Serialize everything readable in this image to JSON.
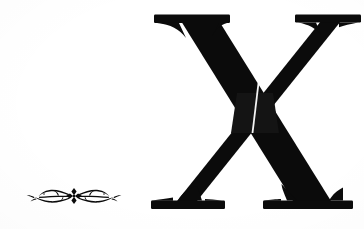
{
  "page": {
    "kind": "scanned-book-page",
    "background_color": "#ffffff",
    "ink_color": "#0b0b0b",
    "width": 364,
    "height": 229
  },
  "initial": {
    "character": "X",
    "role": "chapter-initial-capital",
    "style": "serif-didone-slab-serif",
    "color": "#0b0b0b",
    "position": {
      "left": 145,
      "top": 5,
      "width": 216,
      "height": 220
    },
    "description": "Large black serif capital letter X with flat bracketed slab serifs at all four terminals and a thin hairline seam where the two strokes cross"
  },
  "ornament": {
    "role": "decorative-rule",
    "name": "floral-flourish-ornament",
    "color": "#0b0b0b",
    "position": {
      "left": 22,
      "top": 180,
      "width": 104,
      "height": 32
    },
    "description": "Small horizontal typographic flourish: a central four-lobed diamond quatrefoil flanked by mirrored scrolling vine tendrils and leaf tips"
  }
}
